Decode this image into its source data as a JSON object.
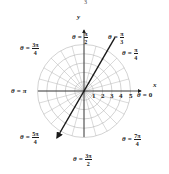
{
  "diagram": {
    "type": "polar-coordinate-grid",
    "center": {
      "x": 84,
      "y": 91
    },
    "ring_count": 5,
    "ring_spacing_px": 9.3,
    "radial_step_deg": 15,
    "grid_color": "#b5b5b5",
    "axis_color": "#1a1a1a",
    "line_color": "#1a1a1a",
    "highlighted_line": {
      "angle": "θ = π/3",
      "through_origin": true,
      "arrow_direction": "lower-left"
    }
  },
  "cropped_fragment": "3",
  "axes": {
    "x_label": "x",
    "y_label": "y",
    "x_ticks": [
      "1",
      "2",
      "3",
      "4",
      "5"
    ]
  },
  "angle_labels": [
    {
      "id": "pi-over-2",
      "theta": "θ",
      "eq": "=",
      "num": "π",
      "den": "2"
    },
    {
      "id": "pi-over-3",
      "theta": "θ",
      "eq": "=",
      "num": "π",
      "den": "3"
    },
    {
      "id": "pi-over-4",
      "theta": "θ",
      "eq": "=",
      "num": "π",
      "den": "4"
    },
    {
      "id": "3pi-over-4",
      "theta": "θ",
      "eq": "=",
      "num": "3π",
      "den": "4"
    },
    {
      "id": "pi",
      "theta": "θ",
      "eq": "=",
      "value": "π"
    },
    {
      "id": "zero",
      "theta": "θ",
      "eq": "=",
      "value": "0"
    },
    {
      "id": "5pi-over-4",
      "theta": "θ",
      "eq": "=",
      "num": "5π",
      "den": "4"
    },
    {
      "id": "7pi-over-4",
      "theta": "θ",
      "eq": "=",
      "num": "7π",
      "den": "4"
    },
    {
      "id": "3pi-over-2",
      "theta": "θ",
      "eq": "=",
      "num": "3π",
      "den": "2"
    }
  ]
}
